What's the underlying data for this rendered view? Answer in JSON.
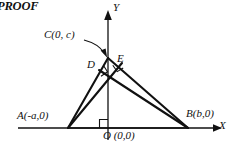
{
  "figure": {
    "heading": "PROOF",
    "kind": "geometry-diagram",
    "stroke_color": "#111111",
    "background_color": "#ffffff",
    "axes": {
      "x_label": "X",
      "y_label": "Y",
      "origin_label": "O (0,0)",
      "x_axis_y": 128,
      "y_axis_x": 108
    },
    "points": [
      {
        "id": "C",
        "label": "C(0, c)",
        "x": 108,
        "y": 58
      },
      {
        "id": "D",
        "label": "D",
        "x": 99,
        "y": 70
      },
      {
        "id": "E",
        "label": "E",
        "x": 122,
        "y": 63
      },
      {
        "id": "A",
        "label": "A(-a,0)",
        "x": 68,
        "y": 128
      },
      {
        "id": "B",
        "label": "B(b,0)",
        "x": 188,
        "y": 128
      },
      {
        "id": "O",
        "label": "O (0,0)",
        "x": 108,
        "y": 128
      }
    ],
    "segments": [
      {
        "from": "A",
        "to": "C"
      },
      {
        "from": "C",
        "to": "B"
      },
      {
        "from": "A",
        "to": "B"
      },
      {
        "from": "A",
        "to": "E"
      },
      {
        "from": "B",
        "to": "D"
      }
    ],
    "right_angle_marks": [
      {
        "at": "D"
      },
      {
        "at": "E"
      },
      {
        "at": "O"
      }
    ],
    "callout": {
      "from_label": "C(0, c)",
      "to_point": "C",
      "style": "curved-arrow"
    }
  }
}
